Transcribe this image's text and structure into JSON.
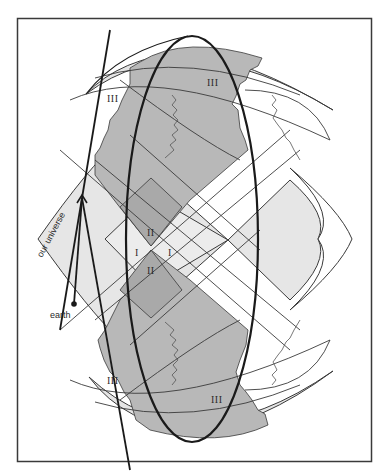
{
  "figure": {
    "labels": {
      "our_universe": "our universe",
      "earth": "earth",
      "region_I_left": "I",
      "region_I_right": "I",
      "region_II_top": "II",
      "region_II_bottom": "II",
      "region_III_top_left": "III",
      "region_III_top": "III",
      "region_III_bottom_left": "III",
      "region_III_bottom": "III"
    },
    "colors": {
      "background": "#ffffff",
      "frame": "#3a3a3a",
      "light_fill": "#e6e6e6",
      "medium_fill": "#bfbfbf",
      "dark_fill": "#a8a8a8",
      "line": "#3a3a3a",
      "heavy_line": "#1a1a1a"
    }
  }
}
